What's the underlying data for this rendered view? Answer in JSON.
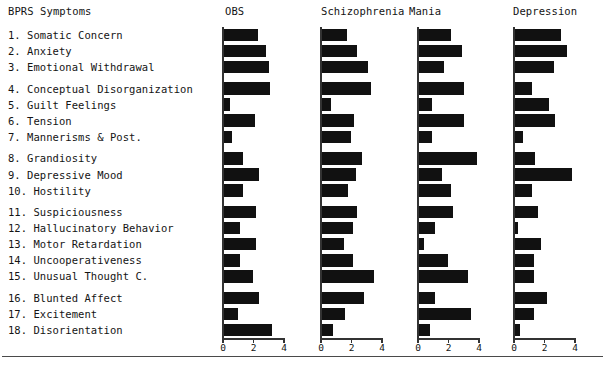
{
  "header": {
    "row_label_title": "BPRS Symptoms",
    "columns": [
      "OBS",
      "Schizophrenia",
      "Mania",
      "Depression"
    ]
  },
  "symptoms": [
    "1. Somatic Concern",
    "2. Anxiety",
    "3. Emotional Withdrawal",
    "4. Conceptual Disorganization",
    "5. Guilt Feelings",
    "6. Tension",
    "7. Mannerisms & Post.",
    "8. Grandiosity",
    "9. Depressive Mood",
    "10. Hostility",
    "11. Suspiciousness",
    "12. Hallucinatory Behavior",
    "13. Motor Retardation",
    "14. Uncooperativeness",
    "15. Unusual Thought C.",
    "16. Blunted Affect",
    "17. Excitement",
    "18. Disorientation"
  ],
  "axis": {
    "ticks": [
      0,
      2,
      4
    ],
    "tick_labels": [
      "0",
      "2",
      "4"
    ],
    "min": 0,
    "max": 4
  },
  "colors": {
    "bar": "#111111",
    "axis": "#333333",
    "text": "#141414",
    "rule": "#4a4a4a",
    "background": "#ffffff"
  },
  "chart_data": {
    "type": "bar",
    "title": "BPRS Symptoms",
    "xlabel": "",
    "ylabel": "",
    "xlim": [
      0,
      4
    ],
    "grid": false,
    "legend": "none",
    "orientation": "horizontal",
    "panels": [
      "OBS",
      "Schizophrenia",
      "Mania",
      "Depression"
    ],
    "categories": [
      "1. Somatic Concern",
      "2. Anxiety",
      "3. Emotional Withdrawal",
      "4. Conceptual Disorganization",
      "5. Guilt Feelings",
      "6. Tension",
      "7. Mannerisms & Post.",
      "8. Grandiosity",
      "9. Depressive Mood",
      "10. Hostility",
      "11. Suspiciousness",
      "12. Hallucinatory Behavior",
      "13. Motor Retardation",
      "14. Uncooperativeness",
      "15. Unusual Thought C.",
      "16. Blunted Affect",
      "17. Excitement",
      "18. Disorientation"
    ],
    "series": [
      {
        "name": "OBS",
        "values": [
          2.35,
          2.85,
          3.05,
          3.15,
          0.55,
          2.15,
          0.65,
          1.35,
          2.45,
          1.35,
          2.25,
          1.15,
          2.25,
          1.15,
          2.05,
          2.45,
          1.05,
          3.25
        ]
      },
      {
        "name": "Schizophrenia",
        "values": [
          1.75,
          2.45,
          3.15,
          3.35,
          0.75,
          2.25,
          2.05,
          2.75,
          2.35,
          1.85,
          2.45,
          2.15,
          1.55,
          2.15,
          3.55,
          2.85,
          1.65,
          0.85
        ]
      },
      {
        "name": "Mania",
        "values": [
          2.25,
          2.95,
          1.75,
          3.05,
          0.95,
          3.05,
          0.95,
          3.95,
          1.65,
          2.25,
          2.35,
          1.15,
          0.45,
          2.05,
          3.35,
          1.15,
          3.55,
          0.85
        ]
      },
      {
        "name": "Depression",
        "values": [
          3.15,
          3.55,
          2.65,
          1.25,
          2.35,
          2.75,
          0.65,
          1.45,
          3.85,
          1.25,
          1.65,
          0.35,
          1.85,
          1.35,
          1.35,
          2.25,
          1.35,
          0.45
        ]
      }
    ]
  }
}
